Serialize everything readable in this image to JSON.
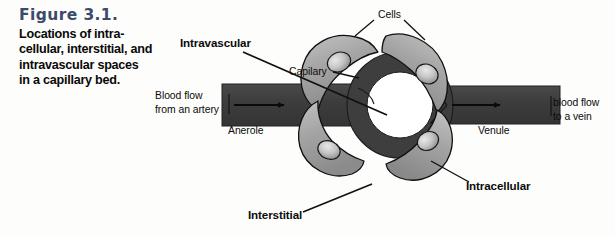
{
  "figure": {
    "number": "Figure 3.1.",
    "caption_lines": [
      "Locations of intra-",
      "cellular, interstitial, and",
      "intravascular spaces",
      "in a capillary bed."
    ],
    "number_color": "#3c4a6b",
    "caption_color": "#0a0a0a"
  },
  "labels": {
    "intravascular": "Intravascular",
    "cells": "Cells",
    "capilary": "Capilary",
    "blood_flow_artery_line1": "Blood flow",
    "blood_flow_artery_line2": "from an artery",
    "blood_flow_vein_line1": "blood flow",
    "blood_flow_vein_line2": "to a vein",
    "anerole": "Anerole",
    "venule": "Venule",
    "intracellular": "Intracellular",
    "interstitial": "Interstitial"
  },
  "diagram": {
    "colors": {
      "background": "#fdfdfb",
      "vessel_wall": "#3e3e3e",
      "vessel_lumen": "#ffffff",
      "cell_fill": "#9b9b9b",
      "cell_fill_light": "#bdbdbd",
      "cell_outline": "#111111",
      "nucleus_fill": "#c9c9c9",
      "leader_line": "#111111",
      "arrow": "#0a0a0a"
    },
    "ring": {
      "center_x": 400,
      "center_y": 105,
      "outer_radius": 53,
      "inner_radius": 33
    },
    "vessels": [
      {
        "name": "arteriole",
        "side": "left",
        "x": 222,
        "y": 84,
        "width": 130,
        "height": 42,
        "flow_direction": "right"
      },
      {
        "name": "venule",
        "side": "right",
        "x": 448,
        "y": 86,
        "width": 110,
        "height": 38,
        "flow_direction": "right"
      }
    ],
    "cells": [
      {
        "name": "cell-upper-left",
        "nucleus": true
      },
      {
        "name": "cell-upper-right",
        "nucleus": true
      },
      {
        "name": "cell-lower-left",
        "nucleus": true
      },
      {
        "name": "cell-lower-right",
        "nucleus": true
      }
    ]
  }
}
